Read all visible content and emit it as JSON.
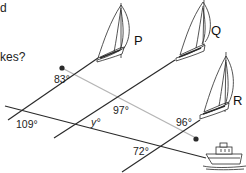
{
  "question_fragment": {
    "line1": "d",
    "line2": "kes?"
  },
  "sailboats": [
    {
      "label": "P"
    },
    {
      "label": "Q"
    },
    {
      "label": "R"
    }
  ],
  "angles": {
    "a83": "83°",
    "a97": "97°",
    "a96": "96°",
    "a109": "109°",
    "ay": "y°",
    "a72": "72°"
  },
  "colors": {
    "line_dark": "#2a2a2a",
    "line_gray": "#b5b5b5",
    "text": "#222222",
    "background": "#ffffff"
  }
}
